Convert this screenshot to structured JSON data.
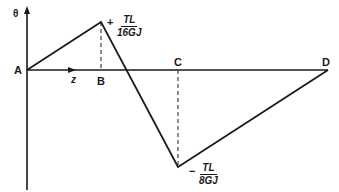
{
  "diagram": {
    "type": "twist-angle-distribution",
    "axes": {
      "y_label": "θ",
      "x_label": "z"
    },
    "points": [
      {
        "name": "A",
        "label": "A"
      },
      {
        "name": "B",
        "label": "B"
      },
      {
        "name": "C",
        "label": "C"
      },
      {
        "name": "D",
        "label": "D"
      }
    ],
    "annotations": {
      "max": {
        "sign": "+",
        "numerator": "TL",
        "denominator": "16GJ"
      },
      "min": {
        "sign": "−",
        "numerator": "TL",
        "denominator": "8GJ"
      }
    },
    "colors": {
      "line": "#1a1a1a",
      "background": "#ffffff"
    }
  }
}
